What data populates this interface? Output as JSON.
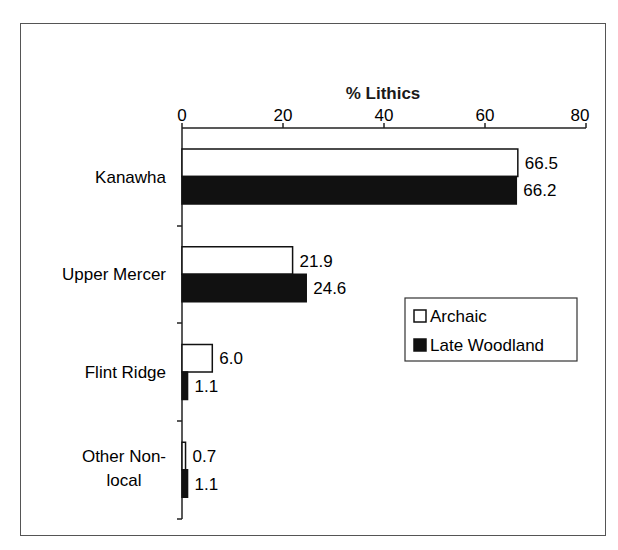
{
  "chart_data": {
    "type": "bar",
    "orientation": "horizontal",
    "title": "% Lithics",
    "xlabel": "% Lithics",
    "ylabel": "",
    "xlim": [
      0,
      80
    ],
    "x_ticks": [
      "0",
      "20",
      "40",
      "60",
      "80"
    ],
    "categories": [
      "Kanawha",
      "Upper Mercer",
      "Flint Ridge",
      "Other Non-local"
    ],
    "category_label_lines": [
      [
        "Kanawha"
      ],
      [
        "Upper Mercer"
      ],
      [
        "Flint Ridge"
      ],
      [
        "Other Non-",
        "local"
      ]
    ],
    "series": [
      {
        "name": "Archaic",
        "color": "#ffffff",
        "values": [
          66.5,
          21.9,
          6.0,
          0.7
        ],
        "labels": [
          "66.5",
          "21.9",
          "6.0",
          "0.7"
        ]
      },
      {
        "name": "Late Woodland",
        "color": "#111111",
        "values": [
          66.2,
          24.6,
          1.1,
          1.1
        ],
        "labels": [
          "66.2",
          "24.6",
          "1.1",
          "1.1"
        ]
      }
    ],
    "legend": {
      "position": "right-middle",
      "entries": [
        "Archaic",
        "Late Woodland"
      ]
    },
    "grid": false,
    "axis_position": "top"
  }
}
